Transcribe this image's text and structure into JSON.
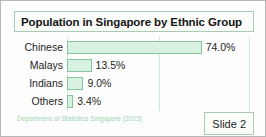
{
  "slide": {
    "title": "Population in Singapore by Ethnic Group",
    "source_note": "Department of Statistics Singapore (2023)",
    "slide_badge": "Slide 2"
  },
  "colors": {
    "bar_fill": "#d9f1e1",
    "bar_border": "#84c79c",
    "gridline": "#cde8d6",
    "note_text": "#9cd3b0",
    "frame": "#b8b8b8"
  },
  "chart_data": {
    "type": "bar",
    "orientation": "horizontal",
    "title": "Population in Singapore by Ethnic Group",
    "xlabel": "",
    "ylabel": "",
    "categories": [
      "Chinese",
      "Malays",
      "Indians",
      "Others"
    ],
    "values": [
      74.0,
      13.5,
      9.0,
      3.4
    ],
    "value_labels": [
      "74.0%",
      "13.5%",
      "9.0%",
      "3.4%"
    ],
    "xlim": [
      0,
      100
    ],
    "grid": true,
    "gridlines_at": [
      0,
      50,
      100
    ],
    "legend": "none",
    "units": "percent"
  }
}
